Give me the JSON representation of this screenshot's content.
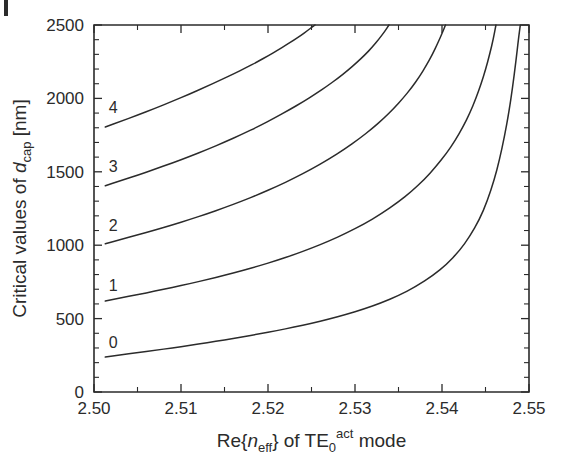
{
  "figure": {
    "margin_mark": "black-corner-mark"
  },
  "chart_data": {
    "type": "line",
    "title": "",
    "subtitle": "",
    "xlabel": "Re{n_eff} of TE_0^act mode",
    "xlabel_parts": {
      "prefix": "Re{",
      "italic_var": "n",
      "var_sub": "eff",
      "middle": "} of TE",
      "mode_sub": "0",
      "mode_sup": "act",
      "suffix": "mode"
    },
    "ylabel": "Critical values of d_cap [nm]",
    "ylabel_parts": {
      "prefix": "Critical values of ",
      "italic_var": "d",
      "var_sub": "cap",
      "suffix": " [nm]"
    },
    "xlim": [
      2.5,
      2.55
    ],
    "ylim": [
      0,
      2500
    ],
    "xticks": [
      2.5,
      2.51,
      2.52,
      2.53,
      2.54,
      2.55
    ],
    "xtick_labels": [
      "2.50",
      "2.51",
      "2.52",
      "2.53",
      "2.54",
      "2.55"
    ],
    "xminor_step": 0.005,
    "yticks": [
      0,
      500,
      1000,
      1500,
      2000,
      2500
    ],
    "ytick_labels": [
      "0",
      "500",
      "1000",
      "1500",
      "2000",
      "2500"
    ],
    "yminor_step": 100,
    "grid": false,
    "legend": "inline-curve-labels",
    "legend_position": "inline",
    "series": [
      {
        "name": "0",
        "label": "0",
        "label_x": 2.5022,
        "label_y": 300,
        "points": [
          [
            2.5013,
            238
          ],
          [
            2.503,
            252
          ],
          [
            2.505,
            268
          ],
          [
            2.507,
            284
          ],
          [
            2.509,
            300
          ],
          [
            2.511,
            318
          ],
          [
            2.513,
            336
          ],
          [
            2.515,
            355
          ],
          [
            2.517,
            375
          ],
          [
            2.519,
            396
          ],
          [
            2.521,
            418
          ],
          [
            2.523,
            442
          ],
          [
            2.525,
            468
          ],
          [
            2.527,
            497
          ],
          [
            2.529,
            529
          ],
          [
            2.531,
            565
          ],
          [
            2.533,
            607
          ],
          [
            2.535,
            657
          ],
          [
            2.537,
            718
          ],
          [
            2.539,
            795
          ],
          [
            2.5405,
            868
          ],
          [
            2.542,
            962
          ],
          [
            2.5432,
            1060
          ],
          [
            2.5443,
            1175
          ],
          [
            2.5452,
            1300
          ],
          [
            2.546,
            1445
          ],
          [
            2.5466,
            1580
          ],
          [
            2.5472,
            1745
          ],
          [
            2.5477,
            1910
          ],
          [
            2.5481,
            2070
          ],
          [
            2.5485,
            2255
          ],
          [
            2.5488,
            2410
          ],
          [
            2.549,
            2500
          ]
        ]
      },
      {
        "name": "1",
        "label": "1",
        "label_x": 2.5022,
        "label_y": 690,
        "points": [
          [
            2.5013,
            620
          ],
          [
            2.503,
            640
          ],
          [
            2.505,
            663
          ],
          [
            2.507,
            687
          ],
          [
            2.509,
            712
          ],
          [
            2.511,
            738
          ],
          [
            2.513,
            766
          ],
          [
            2.515,
            795
          ],
          [
            2.517,
            826
          ],
          [
            2.519,
            860
          ],
          [
            2.521,
            896
          ],
          [
            2.523,
            936
          ],
          [
            2.525,
            980
          ],
          [
            2.527,
            1028
          ],
          [
            2.529,
            1082
          ],
          [
            2.531,
            1143
          ],
          [
            2.533,
            1213
          ],
          [
            2.535,
            1295
          ],
          [
            2.5365,
            1366
          ],
          [
            2.538,
            1450
          ],
          [
            2.5393,
            1535
          ],
          [
            2.5405,
            1625
          ],
          [
            2.5415,
            1712
          ],
          [
            2.5424,
            1805
          ],
          [
            2.5432,
            1900
          ],
          [
            2.5439,
            2000
          ],
          [
            2.5445,
            2100
          ],
          [
            2.545,
            2195
          ],
          [
            2.5455,
            2305
          ],
          [
            2.5459,
            2405
          ],
          [
            2.5462,
            2500
          ]
        ]
      },
      {
        "name": "2",
        "label": "2",
        "label_x": 2.5022,
        "label_y": 1095,
        "points": [
          [
            2.5013,
            1010
          ],
          [
            2.503,
            1038
          ],
          [
            2.505,
            1070
          ],
          [
            2.507,
            1103
          ],
          [
            2.509,
            1138
          ],
          [
            2.511,
            1175
          ],
          [
            2.513,
            1214
          ],
          [
            2.515,
            1256
          ],
          [
            2.517,
            1300
          ],
          [
            2.519,
            1348
          ],
          [
            2.521,
            1400
          ],
          [
            2.523,
            1456
          ],
          [
            2.525,
            1518
          ],
          [
            2.527,
            1586
          ],
          [
            2.5288,
            1654
          ],
          [
            2.5305,
            1726
          ],
          [
            2.532,
            1796
          ],
          [
            2.5333,
            1864
          ],
          [
            2.5345,
            1934
          ],
          [
            2.5355,
            2000
          ],
          [
            2.5365,
            2072
          ],
          [
            2.5374,
            2148
          ],
          [
            2.5382,
            2225
          ],
          [
            2.5389,
            2300
          ],
          [
            2.5395,
            2375
          ],
          [
            2.5401,
            2455
          ],
          [
            2.5404,
            2500
          ]
        ]
      },
      {
        "name": "3",
        "label": "3",
        "label_x": 2.5022,
        "label_y": 1500,
        "points": [
          [
            2.5013,
            1405
          ],
          [
            2.503,
            1438
          ],
          [
            2.505,
            1477
          ],
          [
            2.507,
            1518
          ],
          [
            2.509,
            1560
          ],
          [
            2.511,
            1605
          ],
          [
            2.513,
            1652
          ],
          [
            2.515,
            1702
          ],
          [
            2.517,
            1755
          ],
          [
            2.519,
            1812
          ],
          [
            2.5208,
            1868
          ],
          [
            2.5225,
            1924
          ],
          [
            2.524,
            1976
          ],
          [
            2.5255,
            2032
          ],
          [
            2.5268,
            2084
          ],
          [
            2.528,
            2136
          ],
          [
            2.5292,
            2192
          ],
          [
            2.5302,
            2244
          ],
          [
            2.5311,
            2294
          ],
          [
            2.532,
            2350
          ],
          [
            2.5327,
            2400
          ],
          [
            2.5334,
            2455
          ],
          [
            2.5339,
            2500
          ]
        ]
      },
      {
        "name": "4",
        "label": "4",
        "label_x": 2.5022,
        "label_y": 1900,
        "points": [
          [
            2.5013,
            1805
          ],
          [
            2.503,
            1842
          ],
          [
            2.505,
            1886
          ],
          [
            2.507,
            1932
          ],
          [
            2.509,
            1980
          ],
          [
            2.511,
            2030
          ],
          [
            2.5128,
            2078
          ],
          [
            2.5145,
            2124
          ],
          [
            2.516,
            2166
          ],
          [
            2.5175,
            2210
          ],
          [
            2.5188,
            2250
          ],
          [
            2.52,
            2290
          ],
          [
            2.5211,
            2328
          ],
          [
            2.5221,
            2364
          ],
          [
            2.523,
            2398
          ],
          [
            2.5238,
            2430
          ],
          [
            2.5245,
            2460
          ],
          [
            2.5252,
            2492
          ],
          [
            2.5254,
            2500
          ]
        ]
      }
    ]
  },
  "colors": {
    "curve": "#2b2b2b",
    "axis": "#2b2b2b",
    "background": "#ffffff"
  }
}
